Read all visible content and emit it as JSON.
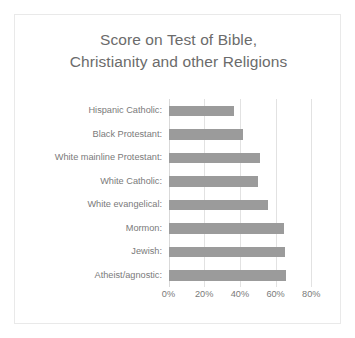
{
  "chart_data": {
    "type": "bar",
    "orientation": "horizontal",
    "title": "Score on Test of Bible, Christianity and other Religions",
    "title_lines": [
      "Score on Test of Bible,",
      "Christianity and other Religions"
    ],
    "xlabel": "",
    "ylabel": "",
    "categories": [
      "Hispanic Catholic:",
      "Black Protestant:",
      "White mainline Protestant:",
      "White Catholic:",
      "White evangelical:",
      "Mormon:",
      "Jewish:",
      "Atheist/agnostic:"
    ],
    "values": [
      36.7,
      42.0,
      51.0,
      50.0,
      56.0,
      64.6,
      65.0,
      66.0
    ],
    "value_labels": [
      "36.7%",
      "42.0%",
      "51.0%",
      "50.0%",
      "56.0%",
      "64.6%",
      "65.0%",
      "66.0%"
    ],
    "xlim": [
      0,
      80
    ],
    "xticks": [
      0,
      20,
      40,
      60,
      80
    ],
    "xtick_labels": [
      "0%",
      "20%",
      "40%",
      "60%",
      "80%"
    ],
    "grid": true,
    "grid_axis": "x",
    "legend": false,
    "series": [
      {
        "name": "Score",
        "values": [
          36.7,
          42.0,
          51.0,
          50.0,
          56.0,
          64.6,
          65.0,
          66.0
        ]
      }
    ]
  },
  "style": {
    "bar_color": "#9b9b9b",
    "grid_color": "#e2e2e2",
    "axis_color": "#d9d9d9",
    "text_color": "#7a7a7a",
    "title_color": "#6b6b6b",
    "border_color": "#e9e9e9",
    "background": "#ffffff"
  }
}
